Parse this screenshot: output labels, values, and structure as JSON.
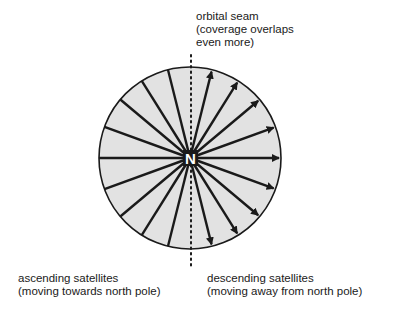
{
  "diagram": {
    "center_label": "N",
    "seam_label": {
      "line1": "orbital seam",
      "line2": "(coverage overlaps",
      "line3": "even more)"
    },
    "ascending_label": {
      "line1": "ascending satellites",
      "line2": "(moving towards north pole)"
    },
    "descending_label": {
      "line1": "descending satellites",
      "line2": "(moving away from north pole)"
    },
    "colors": {
      "disc_fill": "#e2e2e2",
      "stroke": "#1a1a1a",
      "center_text": "#ffffff"
    },
    "geometry": {
      "center": [
        190,
        158
      ],
      "radius": 91,
      "ascending_tracks_deg": [
        180,
        160,
        140,
        122,
        104,
        200,
        220,
        238,
        256
      ],
      "descending_arrows_deg": [
        76,
        58,
        40,
        20,
        0,
        -20,
        -40,
        -58,
        -76
      ]
    }
  }
}
